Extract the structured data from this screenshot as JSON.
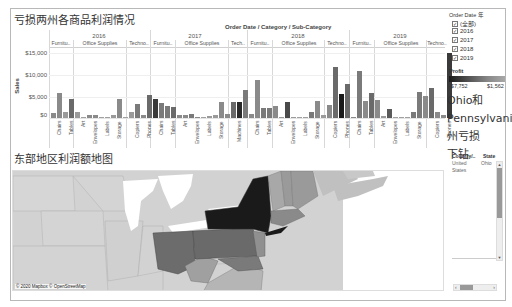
{
  "header": {
    "chart_title": "亏损两州各商品利润情况",
    "column_header": "Order Date / Category / Sub-Category",
    "map_title": "东部地区利润额地图"
  },
  "chart": {
    "y_axis_label": "Sales",
    "y_ticks": [
      "$15,000",
      "$10,000",
      "$5,000",
      "$0"
    ],
    "years": [
      {
        "label": "2016",
        "categories": [
          {
            "label": "Furnitu..",
            "subs": [
              "Chairs",
              "Tables"
            ]
          },
          {
            "label": "Office Supplies",
            "subs": [
              "Art",
              "Envelopes",
              "Labels",
              "Storage"
            ]
          },
          {
            "label": "Techno..",
            "subs": [
              "Copiers",
              "Phones"
            ]
          }
        ]
      },
      {
        "label": "2017",
        "categories": [
          {
            "label": "Furnitu..",
            "subs": [
              "Chairs",
              "Tables"
            ]
          },
          {
            "label": "Office Supplies",
            "subs": [
              "Art",
              "Envelopes",
              "Labels",
              "Storage"
            ]
          },
          {
            "label": "Tech..",
            "subs": [
              "Machines"
            ]
          }
        ]
      },
      {
        "label": "2018",
        "categories": [
          {
            "label": "Furnitu..",
            "subs": [
              "Chairs",
              "Tables"
            ]
          },
          {
            "label": "Office Supplies",
            "subs": [
              "Art",
              "Envelopes",
              "Labels",
              "Storage"
            ]
          },
          {
            "label": "Techno..",
            "subs": [
              "Copiers",
              "Phones"
            ]
          }
        ]
      },
      {
        "label": "2019",
        "categories": [
          {
            "label": "Furnitu..",
            "subs": [
              "Chairs",
              "Tables"
            ]
          },
          {
            "label": "Office Supplies",
            "subs": [
              "Art",
              "Envelopes",
              "Labels",
              "Storage"
            ]
          },
          {
            "label": "Techno..",
            "subs": [
              "Copiers",
              "Phones"
            ]
          }
        ]
      }
    ]
  },
  "chart_data": {
    "type": "bar",
    "title": "亏损两州各商品利润情况",
    "xlabel": "Order Date / Category / Sub-Category",
    "ylabel": "Sales",
    "ylim": [
      -1000,
      16000
    ],
    "y_ticks": [
      "$0",
      "$5,000",
      "$10,000",
      "$15,000"
    ],
    "color_legend": {
      "field": "Profit",
      "min": "-$7,752",
      "max": "$1,562"
    },
    "grid": true,
    "bars": [
      {
        "x": 52,
        "v": 1100,
        "c": "#8a8a8a"
      },
      {
        "x": 58,
        "v": 5800,
        "c": "#8a8a8a"
      },
      {
        "x": 64,
        "v": 1500,
        "c": "#9a9a9a"
      },
      {
        "x": 70,
        "v": 4400,
        "c": "#6a6a6a"
      },
      {
        "x": 76,
        "v": 1300,
        "c": "#9a9a9a"
      },
      {
        "x": 82,
        "v": 300,
        "c": "#a0a0a0"
      },
      {
        "x": 88,
        "v": 800,
        "c": "#8a8a8a"
      },
      {
        "x": 94,
        "v": 700,
        "c": "#8a8a8a"
      },
      {
        "x": 100,
        "v": 100,
        "c": "#a0a0a0"
      },
      {
        "x": 106,
        "v": 100,
        "c": "#a0a0a0"
      },
      {
        "x": 112,
        "v": 800,
        "c": "#9a9a9a"
      },
      {
        "x": 118,
        "v": 4400,
        "c": "#8a8a8a"
      },
      {
        "x": 124,
        "v": 200,
        "c": "#a0a0a0"
      },
      {
        "x": 130,
        "v": 1400,
        "c": "#9a9a9a"
      },
      {
        "x": 136,
        "v": 3300,
        "c": "#7a7a7a"
      },
      {
        "x": 142,
        "v": 800,
        "c": "#8a8a8a"
      },
      {
        "x": 148,
        "v": 5300,
        "c": "#6a6a6a"
      },
      {
        "x": 154,
        "v": 4500,
        "c": "#3a3a3a"
      },
      {
        "x": 160,
        "v": 3500,
        "c": "#7a7a7a"
      },
      {
        "x": 166,
        "v": 2800,
        "c": "#7a7a7a"
      },
      {
        "x": 172,
        "v": 2600,
        "c": "#6a6a6a"
      },
      {
        "x": 178,
        "v": 600,
        "c": "#8a8a8a"
      },
      {
        "x": 184,
        "v": 600,
        "c": "#8a8a8a"
      },
      {
        "x": 190,
        "v": 900,
        "c": "#7a7a7a"
      },
      {
        "x": 196,
        "v": 300,
        "c": "#8a8a8a"
      },
      {
        "x": 202,
        "v": 100,
        "c": "#a0a0a0"
      },
      {
        "x": 208,
        "v": 400,
        "c": "#9a9a9a"
      },
      {
        "x": 214,
        "v": 700,
        "c": "#9a9a9a"
      },
      {
        "x": 220,
        "v": 3800,
        "c": "#8a8a8a"
      },
      {
        "x": 226,
        "v": 900,
        "c": "#8a8a8a"
      },
      {
        "x": 232,
        "v": 3800,
        "c": "#6a6a6a"
      },
      {
        "x": 238,
        "v": 3800,
        "c": "#2a2a2a"
      },
      {
        "x": 244,
        "v": 6500,
        "c": "#7a7a7a"
      },
      {
        "x": 250,
        "v": 1000,
        "c": "#8a8a8a"
      },
      {
        "x": 256,
        "v": 8800,
        "c": "#8a8a8a"
      },
      {
        "x": 262,
        "v": 2300,
        "c": "#7a7a7a"
      },
      {
        "x": 268,
        "v": 2300,
        "c": "#7a7a7a"
      },
      {
        "x": 274,
        "v": 2700,
        "c": "#8a8a8a"
      },
      {
        "x": 280,
        "v": 200,
        "c": "#9a9a9a"
      },
      {
        "x": 286,
        "v": 3800,
        "c": "#4a4a4a"
      },
      {
        "x": 292,
        "v": 300,
        "c": "#9a9a9a"
      },
      {
        "x": 298,
        "v": 200,
        "c": "#a0a0a0"
      },
      {
        "x": 304,
        "v": 200,
        "c": "#a0a0a0"
      },
      {
        "x": 310,
        "v": 1500,
        "c": "#7a7a7a"
      },
      {
        "x": 316,
        "v": 4000,
        "c": "#8a8a8a"
      },
      {
        "x": 322,
        "v": 700,
        "c": "#9a9a9a"
      },
      {
        "x": 328,
        "v": 2900,
        "c": "#8a8a8a"
      },
      {
        "x": 334,
        "v": 11800,
        "c": "#6a6a6a"
      },
      {
        "x": 340,
        "v": 5500,
        "c": "#1a1a1a"
      },
      {
        "x": 346,
        "v": 7900,
        "c": "#6a6a6a"
      },
      {
        "x": 352,
        "v": 300,
        "c": "#8a8a8a"
      },
      {
        "x": 358,
        "v": 10800,
        "c": "#7a7a7a"
      },
      {
        "x": 364,
        "v": 4000,
        "c": "#8a8a8a"
      },
      {
        "x": 370,
        "v": 5800,
        "c": "#6a6a6a"
      },
      {
        "x": 376,
        "v": 4100,
        "c": "#8a8a8a"
      },
      {
        "x": 382,
        "v": 500,
        "c": "#9a9a9a"
      },
      {
        "x": 388,
        "v": 2100,
        "c": "#5a5a5a"
      },
      {
        "x": 394,
        "v": 200,
        "c": "#a0a0a0"
      },
      {
        "x": 400,
        "v": 100,
        "c": "#a0a0a0"
      },
      {
        "x": 406,
        "v": 100,
        "c": "#a0a0a0"
      },
      {
        "x": 412,
        "v": 1300,
        "c": "#7a7a7a"
      },
      {
        "x": 418,
        "v": 6000,
        "c": "#7a7a7a"
      },
      {
        "x": 424,
        "v": 5100,
        "c": "#8a8a8a"
      },
      {
        "x": 430,
        "v": 7000,
        "c": "#6a6a6a"
      },
      {
        "x": 436,
        "v": 1300,
        "c": "#8a8a8a"
      },
      {
        "x": 442,
        "v": 600,
        "c": "#8a8a8a"
      },
      {
        "x": 448,
        "v": 15000,
        "c": "#3a3a3a"
      }
    ],
    "categories": [
      "2016 Furniture Chairs",
      "2016 Furniture Tables",
      "2016 Office Art",
      "2016 Office Envelopes",
      "2016 Office Labels",
      "2016 Office Storage",
      "2016 Tech Copiers",
      "2016 Tech Phones",
      "2017 Furniture Chairs",
      "2017 Furniture Tables",
      "2017 Office Art",
      "2017 Office Envelopes",
      "2017 Office Labels",
      "2017 Office Storage",
      "2017 Tech Machines",
      "2018 Furniture Chairs",
      "2018 Furniture Tables",
      "2018 Office Art",
      "2018 Office Envelopes",
      "2018 Office Labels",
      "2018 Office Storage",
      "2018 Tech Copiers",
      "2018 Tech Phones",
      "2019 Furniture Chairs",
      "2019 Furniture Tables",
      "2019 Office Art",
      "2019 Office Envelopes",
      "2019 Office Labels",
      "2019 Office Storage",
      "2019 Tech Copiers",
      "2019 Tech Phones"
    ]
  },
  "filters": {
    "order_date": {
      "title": "Order Date 年",
      "options": [
        {
          "label": "(全部)",
          "checked": true
        },
        {
          "label": "2016",
          "checked": true
        },
        {
          "label": "2017",
          "checked": true
        },
        {
          "label": "2018",
          "checked": true
        },
        {
          "label": "2019",
          "checked": true
        }
      ]
    },
    "profit_legend": {
      "title": "Profit",
      "min": "-$7,752",
      "max": "$1,562"
    }
  },
  "annotation": {
    "text_line1": "Ohio和",
    "text_line2": "Pennsylvania",
    "text_line3": "州亏损",
    "text_line4": "下钻"
  },
  "detail_table": {
    "columns": [
      "Country/..",
      "State"
    ],
    "rows": [
      [
        "United States",
        "Ohio"
      ]
    ]
  },
  "map": {
    "attribution": "© 2020 Mapbox © OpenStreetMap"
  }
}
